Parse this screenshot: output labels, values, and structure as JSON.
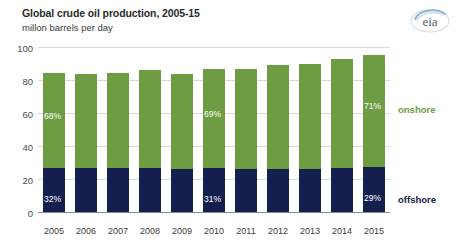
{
  "header": {
    "title": "Global crude oil production, 2005-15",
    "subtitle": "millon barrels per day",
    "logo_text": "eia",
    "logo_name": "eia-logo"
  },
  "legend": {
    "onshore_label": "onshore",
    "offshore_label": "offshore"
  },
  "colors": {
    "onshore": "#6d9c42",
    "offshore": "#13204e",
    "gridline": "#d9d9d9",
    "axis": "#8a8a8a",
    "title_text": "#2b2b2b",
    "tick_text": "#4a4a4a",
    "bar_label_text": "#ffffff"
  },
  "chart_data": {
    "type": "bar",
    "stacked": true,
    "title": "Global crude oil production, 2005-15",
    "subtitle": "millon barrels per day",
    "xlabel": "",
    "ylabel": "millon barrels per day",
    "ylim": [
      0,
      100
    ],
    "yticks": [
      0,
      20,
      40,
      60,
      80,
      100
    ],
    "grid": true,
    "legend_position": "right",
    "categories": [
      "2005",
      "2006",
      "2007",
      "2008",
      "2009",
      "2010",
      "2011",
      "2012",
      "2013",
      "2014",
      "2015"
    ],
    "series": [
      {
        "name": "offshore",
        "color": "#13204e",
        "values": [
          27.2,
          27.2,
          27.2,
          27.2,
          26.6,
          27.0,
          26.4,
          26.7,
          26.7,
          27.2,
          27.8
        ]
      },
      {
        "name": "onshore",
        "color": "#6d9c42",
        "values": [
          57.8,
          57.3,
          57.8,
          59.3,
          57.9,
          60.0,
          60.6,
          63.3,
          63.8,
          66.3,
          68.2
        ]
      }
    ],
    "totals": [
      85.0,
      84.5,
      85.0,
      86.5,
      84.5,
      87.0,
      87.0,
      90.0,
      90.5,
      93.5,
      96.0
    ],
    "annotations": [
      {
        "category": "2005",
        "series": "onshore",
        "text": "68%"
      },
      {
        "category": "2005",
        "series": "offshore",
        "text": "32%"
      },
      {
        "category": "2010",
        "series": "onshore",
        "text": "69%"
      },
      {
        "category": "2010",
        "series": "offshore",
        "text": "31%"
      },
      {
        "category": "2015",
        "series": "onshore",
        "text": "71%"
      },
      {
        "category": "2015",
        "series": "offshore",
        "text": "29%"
      }
    ]
  }
}
